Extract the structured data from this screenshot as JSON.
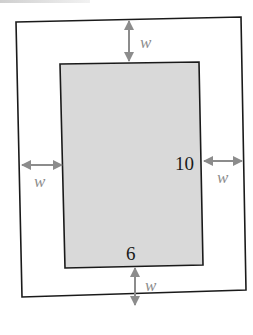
{
  "diagram": {
    "inner_rect": {
      "width_label": "6",
      "height_label": "10",
      "fill": "#d9d9d9"
    },
    "border_label": "w",
    "labels": {
      "top": "w",
      "left": "w",
      "right": "w",
      "bottom": "w",
      "inner_height": "10",
      "inner_width": "6"
    },
    "colors": {
      "arrow": "#8c8c8c",
      "w_label": "#8c8c8c",
      "stroke": "#1a1a1a",
      "inner_fill": "#d9d9d9"
    }
  }
}
